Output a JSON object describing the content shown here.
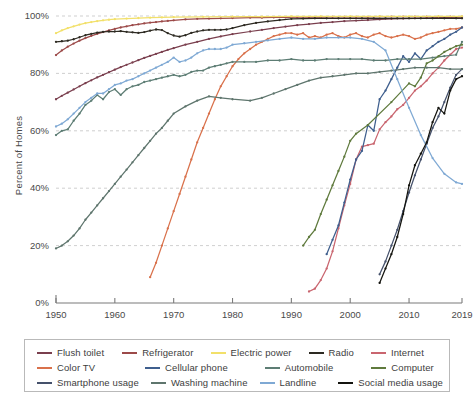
{
  "chart_data": {
    "type": "line",
    "title": "",
    "xlabel": "",
    "ylabel": "Percent of Homes",
    "xlim": [
      1950,
      2019
    ],
    "ylim": [
      0,
      100
    ],
    "grid": true,
    "legend_position": "bottom",
    "x_ticks": [
      "1950",
      "1960",
      "1970",
      "1980",
      "1990",
      "2000",
      "2010",
      "2019"
    ],
    "x_tick_values": [
      1950,
      1960,
      1970,
      1980,
      1990,
      2000,
      2010,
      2019
    ],
    "y_ticks": [
      "0%",
      "20%",
      "40%",
      "60%",
      "80%",
      "100%"
    ],
    "y_tick_values": [
      0,
      20,
      40,
      60,
      80,
      100
    ],
    "series": [
      {
        "name": "Flush toilet",
        "color": "#7a3f4e",
        "x": [
          1950,
          1951,
          1952,
          1953,
          1954,
          1955,
          1956,
          1957,
          1958,
          1959,
          1960,
          1961,
          1962,
          1963,
          1964,
          1965,
          1966,
          1967,
          1968,
          1969,
          1970,
          1972,
          1974,
          1976,
          1978,
          1980,
          1983,
          1985,
          1987,
          1989,
          1991,
          1993,
          1995,
          1997,
          1999,
          2001,
          2003,
          2005,
          2007,
          2009,
          2011,
          2013,
          2015,
          2017,
          2019
        ],
        "values": [
          71.0,
          72.2,
          73.3,
          74.4,
          75.5,
          76.6,
          77.6,
          78.6,
          79.5,
          80.4,
          81.3,
          82.2,
          83.0,
          83.8,
          84.6,
          85.4,
          86.1,
          86.8,
          87.5,
          88.2,
          88.8,
          90.0,
          91.0,
          92.0,
          92.9,
          93.7,
          94.6,
          95.2,
          95.8,
          96.3,
          96.8,
          97.2,
          97.6,
          97.9,
          98.2,
          98.4,
          98.6,
          98.8,
          99.0,
          99.1,
          99.2,
          99.3,
          99.4,
          99.5,
          99.6
        ]
      },
      {
        "name": "Refrigerator",
        "color": "#9c4a49",
        "x": [
          1950,
          1951,
          1952,
          1953,
          1954,
          1955,
          1956,
          1957,
          1958,
          1959,
          1960,
          1961,
          1962,
          1963,
          1964,
          1965,
          1966,
          1967,
          1968,
          1969,
          1970,
          1972,
          1974,
          1976,
          1978,
          1980,
          1983,
          1985,
          1987,
          1989,
          1991,
          1993,
          1995,
          1997,
          1999,
          2001,
          2003,
          2005,
          2007,
          2009,
          2011,
          2013,
          2015,
          2017,
          2019
        ],
        "values": [
          86.4,
          88.0,
          89.3,
          90.4,
          91.4,
          92.3,
          93.1,
          93.8,
          94.4,
          95.0,
          95.5,
          96.0,
          96.4,
          96.8,
          97.1,
          97.4,
          97.7,
          97.9,
          98.1,
          98.3,
          98.5,
          98.8,
          99.0,
          99.1,
          99.2,
          99.3,
          99.4,
          99.4,
          99.5,
          99.5,
          99.6,
          99.6,
          99.6,
          99.7,
          99.7,
          99.7,
          99.7,
          99.8,
          99.8,
          99.8,
          99.8,
          99.8,
          99.8,
          99.8,
          99.8
        ]
      },
      {
        "name": "Electric power",
        "color": "#f2e06a",
        "x": [
          1950,
          1951,
          1952,
          1953,
          1954,
          1955,
          1956,
          1957,
          1958,
          1959,
          1960,
          1962,
          1964,
          1966,
          1968,
          1970,
          1975,
          1980,
          1985,
          1990,
          1995,
          2000,
          2005,
          2010,
          2015,
          2019
        ],
        "values": [
          94.0,
          95.0,
          95.8,
          96.4,
          97.0,
          97.5,
          97.9,
          98.2,
          98.5,
          98.7,
          98.9,
          99.1,
          99.3,
          99.4,
          99.5,
          99.6,
          99.7,
          99.8,
          99.8,
          99.9,
          99.9,
          99.9,
          99.9,
          99.9,
          99.9,
          99.9
        ]
      },
      {
        "name": "Radio",
        "color": "#2d2a22",
        "x": [
          1950,
          1951,
          1952,
          1953,
          1954,
          1955,
          1956,
          1957,
          1958,
          1959,
          1960,
          1961,
          1962,
          1963,
          1964,
          1965,
          1966,
          1967,
          1968,
          1969,
          1970,
          1971,
          1972,
          1973,
          1974,
          1975,
          1976,
          1977,
          1978,
          1979,
          1980,
          1982,
          1984,
          1986,
          1988,
          1990,
          1992,
          1994,
          1996,
          1998,
          2000,
          2002,
          2004,
          2006,
          2008,
          2010,
          2012,
          2014,
          2016,
          2018,
          2019
        ],
        "values": [
          91.0,
          91.2,
          91.4,
          91.9,
          92.6,
          93.3,
          93.8,
          94.2,
          94.5,
          94.6,
          94.6,
          94.7,
          94.5,
          94.3,
          94.1,
          94.4,
          94.9,
          95.3,
          95.1,
          94.0,
          93.2,
          92.8,
          93.3,
          94.1,
          94.6,
          95.0,
          95.2,
          95.2,
          95.2,
          95.3,
          95.8,
          96.8,
          97.6,
          98.1,
          98.6,
          99.0,
          99.1,
          99.2,
          99.2,
          99.2,
          99.2,
          99.2,
          99.2,
          99.2,
          99.2,
          99.2,
          99.2,
          99.2,
          99.2,
          99.2,
          99.2
        ]
      },
      {
        "name": "Internet",
        "color": "#c9656f",
        "x": [
          1993,
          1994,
          1995,
          1996,
          1997,
          1998,
          1999,
          2000,
          2001,
          2002,
          2003,
          2004,
          2005,
          2006,
          2007,
          2008,
          2009,
          2010,
          2011,
          2012,
          2013,
          2014,
          2015,
          2016,
          2017,
          2018,
          2019
        ],
        "values": [
          4.0,
          5.0,
          8.0,
          12.0,
          18.0,
          26.0,
          34.0,
          41.5,
          50.0,
          54.5,
          55.0,
          55.5,
          60.5,
          63.0,
          65.0,
          67.5,
          69.0,
          71.5,
          74.0,
          75.5,
          77.5,
          80.0,
          82.0,
          84.5,
          86.5,
          88.5,
          89.0
        ]
      },
      {
        "name": "Color TV",
        "color": "#d9714b",
        "x": [
          1966,
          1967,
          1968,
          1969,
          1970,
          1971,
          1972,
          1973,
          1974,
          1975,
          1976,
          1977,
          1978,
          1979,
          1980,
          1981,
          1982,
          1983,
          1984,
          1985,
          1986,
          1987,
          1988,
          1989,
          1990,
          1991,
          1992,
          1993,
          1994,
          1995,
          1996,
          1997,
          1998,
          1999,
          2000,
          2001,
          2002,
          2003,
          2004,
          2005,
          2006,
          2007,
          2008,
          2009,
          2010,
          2011,
          2012,
          2013,
          2014,
          2015,
          2016,
          2017,
          2018,
          2019
        ],
        "values": [
          9.0,
          14.0,
          20.0,
          26.0,
          32.0,
          38.0,
          44.0,
          50.0,
          56.0,
          61.0,
          66.0,
          71.0,
          75.5,
          79.0,
          82.5,
          85.0,
          87.0,
          88.5,
          90.0,
          91.0,
          92.0,
          93.0,
          93.5,
          94.0,
          94.0,
          93.5,
          94.0,
          92.5,
          93.0,
          92.5,
          93.5,
          94.0,
          93.0,
          92.5,
          93.5,
          94.0,
          93.0,
          92.5,
          93.5,
          94.0,
          93.0,
          92.5,
          93.0,
          93.5,
          93.0,
          92.0,
          92.5,
          93.5,
          94.0,
          94.5,
          95.0,
          95.5,
          95.5,
          96.0
        ]
      },
      {
        "name": "Cellular phone",
        "color": "#3f5f8e",
        "x": [
          1996,
          1997,
          1998,
          1999,
          2000,
          2001,
          2002,
          2003,
          2004,
          2005,
          2006,
          2007,
          2008,
          2009,
          2010,
          2011,
          2012,
          2013,
          2014,
          2015,
          2016,
          2017,
          2018,
          2019
        ],
        "values": [
          17.0,
          22.0,
          27.0,
          35.0,
          43.0,
          50.0,
          53.0,
          62.0,
          60.0,
          71.0,
          74.0,
          78.0,
          82.0,
          86.0,
          84.0,
          87.0,
          85.0,
          88.0,
          89.5,
          91.0,
          92.0,
          93.5,
          94.5,
          96.0
        ]
      },
      {
        "name": "Automobile",
        "color": "#5d7d74",
        "x": [
          1950,
          1951,
          1952,
          1953,
          1954,
          1955,
          1956,
          1957,
          1958,
          1959,
          1960,
          1961,
          1962,
          1963,
          1964,
          1965,
          1966,
          1967,
          1968,
          1969,
          1970,
          1971,
          1972,
          1973,
          1974,
          1975,
          1976,
          1977,
          1978,
          1979,
          1980,
          1982,
          1984,
          1986,
          1988,
          1990,
          1992,
          1994,
          1996,
          1998,
          2000,
          2002,
          2004,
          2006,
          2008,
          2010,
          2012,
          2014,
          2016,
          2018,
          2019
        ],
        "values": [
          58.5,
          60.0,
          60.5,
          63.5,
          66.0,
          69.0,
          70.5,
          72.5,
          71.0,
          73.5,
          74.5,
          72.5,
          74.5,
          75.5,
          76.0,
          77.0,
          77.5,
          78.0,
          78.5,
          79.0,
          79.5,
          79.0,
          79.5,
          80.5,
          81.0,
          81.0,
          82.0,
          82.5,
          83.0,
          83.5,
          84.0,
          84.0,
          84.0,
          84.5,
          84.5,
          85.0,
          84.5,
          84.5,
          85.0,
          85.0,
          85.0,
          85.0,
          84.5,
          84.5,
          85.0,
          85.0,
          85.0,
          85.5,
          86.0,
          86.5,
          91.0
        ]
      },
      {
        "name": "Computer",
        "color": "#5f7a3d",
        "x": [
          1992,
          1993,
          1994,
          1995,
          1996,
          1997,
          1998,
          1999,
          2000,
          2001,
          2003,
          2007,
          2010,
          2011,
          2012,
          2013,
          2014,
          2015,
          2016,
          2017,
          2018,
          2019
        ],
        "values": [
          20.0,
          23.0,
          25.5,
          31.0,
          36.0,
          41.0,
          46.0,
          51.0,
          56.5,
          59.0,
          62.0,
          70.0,
          76.5,
          75.5,
          78.5,
          83.5,
          84.5,
          86.0,
          87.5,
          88.5,
          89.5,
          90.0
        ]
      },
      {
        "name": "Smartphone usage",
        "color": "#45516b",
        "x": [
          2005,
          2006,
          2007,
          2008,
          2009,
          2010,
          2011,
          2012,
          2013,
          2014,
          2015,
          2016,
          2017,
          2018,
          2019
        ],
        "values": [
          10.0,
          14.5,
          20.0,
          25.5,
          32.0,
          38.5,
          44.5,
          50.0,
          55.5,
          61.0,
          65.0,
          70.0,
          75.0,
          79.5,
          81.5
        ]
      },
      {
        "name": "Washing machine",
        "color": "#5e756d",
        "x": [
          1950,
          1951,
          1952,
          1953,
          1954,
          1955,
          1956,
          1957,
          1958,
          1959,
          1960,
          1961,
          1962,
          1963,
          1964,
          1965,
          1966,
          1967,
          1968,
          1969,
          1970,
          1972,
          1974,
          1976,
          1978,
          1980,
          1983,
          1985,
          1987,
          1989,
          1991,
          1993,
          1995,
          1997,
          1999,
          2001,
          2003,
          2005,
          2007,
          2009,
          2011,
          2013,
          2015,
          2017,
          2019
        ],
        "values": [
          19.0,
          20.0,
          21.5,
          23.5,
          26.0,
          29.0,
          31.5,
          34.0,
          36.5,
          39.0,
          41.5,
          44.0,
          46.5,
          49.0,
          51.5,
          54.0,
          56.5,
          59.0,
          61.0,
          63.5,
          66.0,
          68.5,
          70.5,
          72.0,
          71.5,
          71.0,
          70.5,
          71.5,
          73.0,
          74.5,
          76.0,
          77.5,
          78.5,
          79.0,
          79.5,
          80.0,
          80.0,
          80.5,
          81.0,
          81.5,
          82.0,
          82.0,
          82.0,
          81.5,
          81.5
        ]
      },
      {
        "name": "Landline",
        "color": "#7fa9d4",
        "x": [
          1950,
          1951,
          1952,
          1953,
          1954,
          1955,
          1956,
          1957,
          1958,
          1959,
          1960,
          1961,
          1962,
          1963,
          1964,
          1965,
          1966,
          1967,
          1968,
          1969,
          1970,
          1971,
          1972,
          1973,
          1974,
          1975,
          1976,
          1977,
          1978,
          1979,
          1980,
          1982,
          1984,
          1986,
          1988,
          1990,
          1992,
          1994,
          1996,
          1998,
          2000,
          2002,
          2004,
          2006,
          2008,
          2010,
          2012,
          2014,
          2016,
          2018,
          2019
        ],
        "values": [
          61.5,
          62.5,
          64.0,
          66.0,
          68.0,
          70.0,
          71.5,
          73.0,
          73.0,
          74.5,
          76.0,
          76.5,
          77.5,
          78.0,
          79.0,
          80.0,
          81.0,
          82.0,
          83.0,
          84.0,
          85.5,
          84.0,
          84.5,
          85.5,
          87.0,
          88.0,
          88.5,
          88.5,
          88.5,
          89.0,
          90.0,
          90.5,
          91.0,
          91.5,
          92.0,
          92.5,
          92.0,
          92.0,
          92.5,
          92.5,
          92.5,
          92.0,
          91.0,
          88.0,
          78.0,
          68.0,
          58.5,
          50.5,
          45.0,
          42.0,
          41.5
        ]
      },
      {
        "name": "Social media usage",
        "color": "#14140f",
        "x": [
          2005,
          2006,
          2007,
          2008,
          2009,
          2010,
          2011,
          2012,
          2013,
          2014,
          2015,
          2016,
          2017,
          2018,
          2019
        ],
        "values": [
          7.0,
          12.0,
          17.0,
          23.0,
          31.0,
          41.0,
          48.0,
          52.0,
          56.0,
          63.0,
          68.0,
          66.0,
          74.0,
          78.0,
          79.0
        ]
      }
    ]
  },
  "axis": {
    "y_title": "Percent of Homes"
  },
  "legend": {
    "rows": [
      [
        {
          "label": "Flush toilet",
          "color": "#7a3f4e"
        },
        {
          "label": "Refrigerator",
          "color": "#9c4a49"
        },
        {
          "label": "Electric power",
          "color": "#f2e06a"
        },
        {
          "label": "Radio",
          "color": "#2d2a22"
        },
        {
          "label": "Internet",
          "color": "#c9656f"
        }
      ],
      [
        {
          "label": "Color TV",
          "color": "#d9714b"
        },
        {
          "label": "Cellular phone",
          "color": "#3f5f8e"
        },
        {
          "label": "Automobile",
          "color": "#5d7d74"
        },
        {
          "label": "Computer",
          "color": "#5f7a3d"
        }
      ],
      [
        {
          "label": "Smartphone usage",
          "color": "#45516b"
        },
        {
          "label": "Washing machine",
          "color": "#5e756d"
        },
        {
          "label": "Landline",
          "color": "#7fa9d4"
        },
        {
          "label": "Social media usage",
          "color": "#14140f"
        }
      ]
    ]
  }
}
